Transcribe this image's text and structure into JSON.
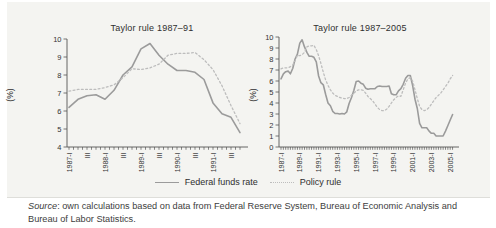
{
  "figure": {
    "legend": [
      {
        "name": "Federal funds rate",
        "style": "solid"
      },
      {
        "name": "Policy rule",
        "style": "dotted"
      }
    ],
    "source": {
      "label": "Source",
      "text": ": own calculations based on data from Federal Reserve System, Bureau of Economic Analysis and Bureau of Labor Statistics."
    }
  },
  "colors": {
    "fed_funds_line": "#9b9b9b",
    "policy_rule_line": "#bdbdbd",
    "axis": "#555555",
    "tick_text": "#333333",
    "panel_bg": "#f4f4f1"
  },
  "chart_data": [
    {
      "type": "line",
      "title": "Taylor rule 1987–91",
      "ylabel": "(%)",
      "xlabel": "",
      "ylim": [
        4,
        10
      ],
      "yticks": [
        10,
        9,
        8,
        7,
        6,
        5,
        4
      ],
      "grid": false,
      "x_unit": "quarter",
      "x_range": [
        "1987-I",
        "1991-IV"
      ],
      "x_tick_labels": [
        "1987-I",
        "III",
        "1988-I",
        "III",
        "1989-I",
        "III",
        "1990-I",
        "III",
        "1991-I",
        "III"
      ],
      "label_every_quarters": 2,
      "series": [
        {
          "name": "Federal funds rate",
          "style": "solid",
          "values": [
            6.2,
            6.65,
            6.85,
            6.9,
            6.65,
            7.15,
            8.0,
            8.45,
            9.45,
            9.75,
            9.1,
            8.6,
            8.25,
            8.25,
            8.15,
            7.75,
            6.45,
            5.85,
            5.65,
            4.8
          ]
        },
        {
          "name": "Policy rule",
          "style": "dotted",
          "values": [
            7.1,
            7.2,
            7.2,
            7.2,
            7.3,
            7.45,
            7.85,
            8.35,
            8.3,
            8.4,
            8.6,
            9.1,
            9.2,
            9.2,
            9.25,
            8.85,
            8.3,
            7.4,
            6.3,
            5.3
          ]
        }
      ]
    },
    {
      "type": "line",
      "title": "Taylor rule 1987–2005",
      "ylabel": "(%)",
      "xlabel": "",
      "ylim": [
        0,
        10
      ],
      "yticks": [
        10,
        9,
        8,
        7,
        6,
        5,
        4,
        3,
        2,
        1,
        0
      ],
      "grid": false,
      "x_unit": "quarter",
      "x_range": [
        "1987-I",
        "2005-II"
      ],
      "x_tick_labels": [
        "1987-I",
        "1989-I",
        "1991-I",
        "1993-I",
        "1995-I",
        "1997-I",
        "1999-I",
        "2001-I",
        "2003-I",
        "2005-I"
      ],
      "label_every_quarters": 8,
      "series": [
        {
          "name": "Federal funds rate",
          "style": "solid",
          "values": [
            6.2,
            6.65,
            6.85,
            6.9,
            6.65,
            7.15,
            8.0,
            8.45,
            9.45,
            9.75,
            9.1,
            8.6,
            8.25,
            8.25,
            8.15,
            7.75,
            6.45,
            5.85,
            5.65,
            4.8,
            4.0,
            3.75,
            3.25,
            3.05,
            3.05,
            3.0,
            3.05,
            3.0,
            3.2,
            3.95,
            4.5,
            5.15,
            5.95,
            6.0,
            5.8,
            5.7,
            5.35,
            5.25,
            5.3,
            5.3,
            5.3,
            5.5,
            5.55,
            5.5,
            5.5,
            5.5,
            5.55,
            4.85,
            4.75,
            4.75,
            5.1,
            5.3,
            5.7,
            6.25,
            6.5,
            6.5,
            5.6,
            4.35,
            3.5,
            2.15,
            1.75,
            1.75,
            1.75,
            1.45,
            1.25,
            1.25,
            1.0,
            1.0,
            1.0,
            1.0,
            1.45,
            1.95,
            2.45,
            2.95
          ]
        },
        {
          "name": "Policy rule",
          "style": "dotted",
          "values": [
            7.1,
            7.2,
            7.2,
            7.2,
            7.3,
            7.45,
            7.85,
            8.35,
            8.3,
            8.4,
            8.6,
            9.1,
            9.2,
            9.2,
            9.25,
            8.85,
            8.3,
            7.6,
            6.8,
            6.1,
            5.6,
            5.2,
            4.9,
            4.7,
            4.6,
            4.5,
            4.45,
            4.4,
            4.4,
            4.5,
            4.7,
            4.9,
            5.1,
            5.2,
            5.2,
            5.15,
            4.9,
            4.6,
            4.4,
            4.2,
            3.9,
            3.6,
            3.4,
            3.3,
            3.3,
            3.45,
            3.7,
            4.0,
            4.3,
            4.5,
            4.65,
            4.6,
            5.2,
            5.8,
            6.2,
            6.3,
            6.0,
            5.2,
            4.4,
            3.7,
            3.4,
            3.3,
            3.4,
            3.6,
            3.9,
            4.2,
            4.5,
            4.7,
            4.9,
            5.2,
            5.5,
            5.8,
            6.2,
            6.5
          ]
        }
      ]
    }
  ]
}
